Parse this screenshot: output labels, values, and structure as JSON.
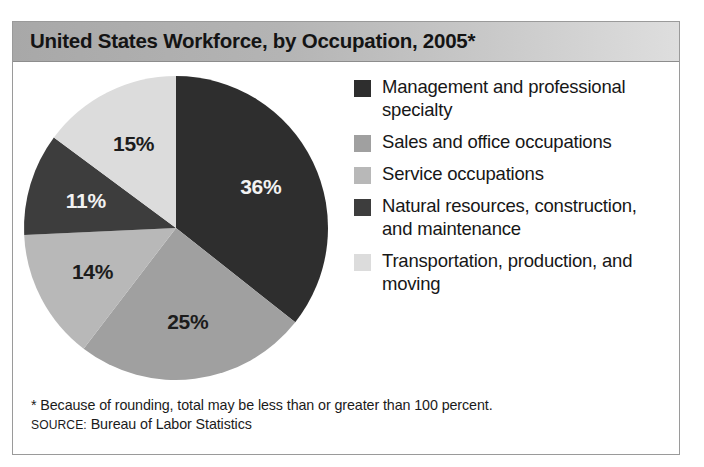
{
  "figure": {
    "title": "United States Workforce, by Occupation, 2005*",
    "panel_border_color": "#9a9a9a"
  },
  "footnote": {
    "asterisk_note": "* Because of rounding, total may be less than or greater than 100 percent.",
    "source_label": "SOURCE:",
    "source_value": " Bureau of Labor Statistics"
  },
  "legend": {
    "items": [
      {
        "label": "Management and professional specialty",
        "color": "#2e2e2e"
      },
      {
        "label": "Sales and office occupations",
        "color": "#a0a0a0"
      },
      {
        "label": "Service occupations",
        "color": "#b8b8b8"
      },
      {
        "label": "Natural resources, construction, and maintenance",
        "color": "#3d3d3d"
      },
      {
        "label": "Transportation, production, and moving",
        "color": "#dcdcdc"
      }
    ]
  },
  "chart_data": {
    "type": "pie",
    "title": "United States Workforce, by Occupation, 2005*",
    "xlabel": "",
    "ylabel": "",
    "units": "percent",
    "start_angle_deg": 0,
    "direction": "clockwise",
    "legend_position": "right",
    "grid": false,
    "categories": [
      "Management and professional specialty",
      "Sales and office occupations",
      "Service occupations",
      "Natural resources, construction, and maintenance",
      "Transportation, production, and moving"
    ],
    "values": [
      36,
      25,
      14,
      11,
      15
    ],
    "data_labels": [
      "36%",
      "25%",
      "14%",
      "11%",
      "15%"
    ],
    "colors": [
      "#2e2e2e",
      "#a0a0a0",
      "#b8b8b8",
      "#3d3d3d",
      "#dcdcdc"
    ],
    "label_text_colors": [
      "#f2f2f2",
      "#1c1c1c",
      "#1c1c1c",
      "#f2f2f2",
      "#1c1c1c"
    ],
    "total": 101,
    "note": "* Because of rounding, total may be less than or greater than 100 percent.",
    "source": "SOURCE: Bureau of Labor Statistics"
  }
}
